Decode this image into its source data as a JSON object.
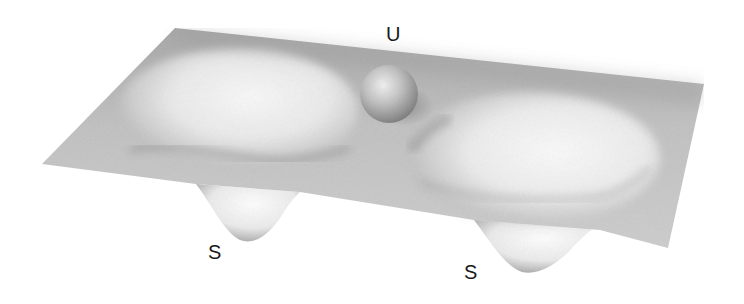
{
  "diagram": {
    "type": "double-well potential surface",
    "labels": {
      "unstable": "U",
      "stable_left": "S",
      "stable_right": "S"
    },
    "colors": {
      "background": "#ffffff",
      "surface_base": "#bdbdbd",
      "surface_light": "#f4f4f4",
      "surface_shadow": "#9a9a9a",
      "ball": "#b5b5b5",
      "text": "#1a1a1a"
    }
  }
}
